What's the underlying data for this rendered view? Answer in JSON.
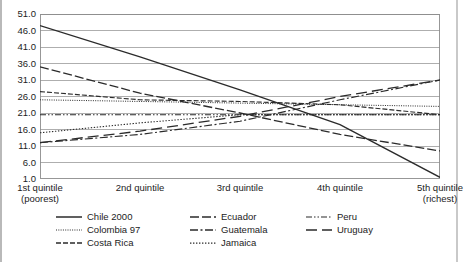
{
  "chart_data": {
    "type": "line",
    "title": "",
    "xlabel": "",
    "ylabel": "",
    "grid": true,
    "legend_position": "bottom",
    "categories": [
      "1st quintile (poorest)",
      "2nd quintile",
      "3rd quintile",
      "4th quintile",
      "5th quintile (richest)"
    ],
    "x_tick_labels": [
      {
        "line1": "1st quintile",
        "line2": "(poorest)"
      },
      {
        "line1": "2nd quintile",
        "line2": ""
      },
      {
        "line1": "3rd quintile",
        "line2": ""
      },
      {
        "line1": "4th quintile",
        "line2": ""
      },
      {
        "line1": "5th quintile",
        "line2": "(richest)"
      }
    ],
    "y_tick_labels": [
      "51.0",
      "46.0",
      "41.0",
      "36.0",
      "31.0",
      "26.0",
      "21.0",
      "16.0",
      "11.0",
      "6.0",
      "1.0"
    ],
    "ylim": [
      1.0,
      51.0
    ],
    "y_tick_step": 5.0,
    "series": [
      {
        "name": "Chile 2000",
        "dash": "solid",
        "values": [
          47.5,
          38.0,
          28.0,
          17.5,
          1.5
        ]
      },
      {
        "name": "Colombia 97",
        "dash": "fine-dotted",
        "values": [
          25.0,
          24.5,
          24.0,
          23.5,
          23.0
        ]
      },
      {
        "name": "Costa Rica",
        "dash": "dashed",
        "values": [
          27.5,
          25.0,
          24.5,
          23.5,
          20.5
        ]
      },
      {
        "name": "Ecuador",
        "dash": "long-dashed",
        "values": [
          35.0,
          27.0,
          21.0,
          14.5,
          9.5
        ]
      },
      {
        "name": "Guatemala",
        "dash": "dash-dot",
        "values": [
          12.0,
          14.5,
          18.5,
          25.0,
          31.0
        ]
      },
      {
        "name": "Jamaica",
        "dash": "dotted",
        "values": [
          15.0,
          18.0,
          20.5,
          20.5,
          20.5
        ]
      },
      {
        "name": "Peru",
        "dash": "dash-dot-dot",
        "values": [
          20.5,
          20.5,
          20.5,
          20.5,
          20.5
        ]
      },
      {
        "name": "Uruguay",
        "dash": "wide-dashed",
        "values": [
          12.0,
          15.5,
          20.0,
          26.0,
          31.0
        ]
      }
    ]
  },
  "legend": {
    "columns": [
      {
        "items": [
          "Chile 2000",
          "Colombia 97",
          "Costa Rica"
        ]
      },
      {
        "items": [
          "Ecuador",
          "Guatemala",
          "Jamaica"
        ]
      },
      {
        "items": [
          "Peru",
          "Uruguay"
        ]
      }
    ]
  },
  "colors": {
    "line": "#2b2b2b",
    "grid": "#9a9a9a",
    "axis": "#8c8c8c",
    "text": "#1c1c1c",
    "background": "#ffffff"
  }
}
